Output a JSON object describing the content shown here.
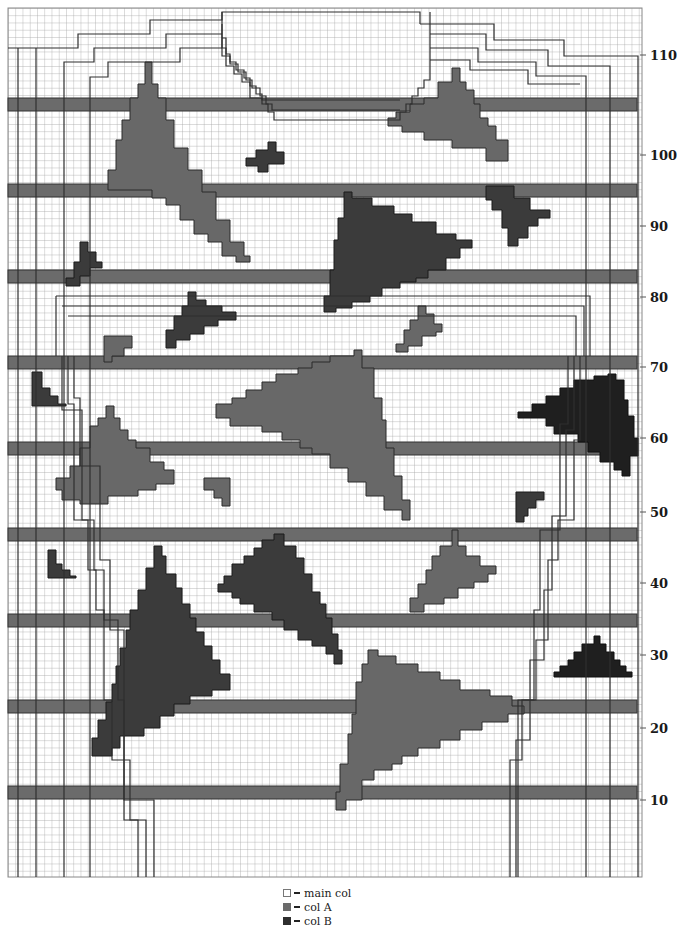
{
  "chart_info": {
    "type": "knitting colorwork chart",
    "grid_cell_px": 7.25,
    "colors": {
      "main_col": "#ffffff",
      "col_a": "#6b6b6b",
      "col_b": "#3a3a3a",
      "col_b_dark": "#1e1e1e",
      "grid_line": "#9a9a9a",
      "outline": "#2a2a2a"
    }
  },
  "row_labels": [
    {
      "label": "110",
      "y": 48
    },
    {
      "label": "100",
      "y": 148
    },
    {
      "label": "90",
      "y": 219
    },
    {
      "label": "80",
      "y": 290
    },
    {
      "label": "70",
      "y": 360
    },
    {
      "label": "60",
      "y": 431
    },
    {
      "label": "50",
      "y": 505
    },
    {
      "label": "40",
      "y": 576
    },
    {
      "label": "30",
      "y": 648
    },
    {
      "label": "20",
      "y": 721
    },
    {
      "label": "10",
      "y": 793
    }
  ],
  "legend": {
    "items": [
      {
        "symbol": "empty-square",
        "label": "main col"
      },
      {
        "symbol": "col-a-square",
        "label": "col A"
      },
      {
        "symbol": "col-b-square",
        "label": "col B"
      }
    ]
  }
}
